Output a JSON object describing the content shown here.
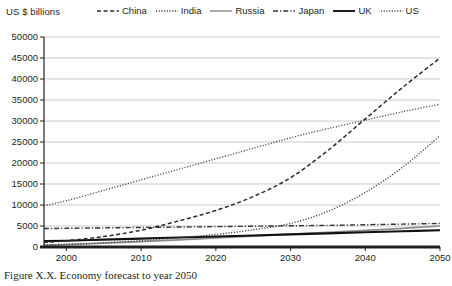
{
  "axis_title": "US $ billions",
  "caption": "Figure X.X. Economy forecast to year 2050",
  "colors": {
    "axis": "#231f20",
    "grid": "#c9c9c9",
    "china": "#2b2b2b",
    "india": "#3d3d3d",
    "russia": "#8c8c8c",
    "japan": "#333333",
    "uk": "#111111",
    "us": "#4a4a4a"
  },
  "legend": {
    "items": [
      {
        "label": "China",
        "style": "dashed",
        "icon": "dashed-line-icon"
      },
      {
        "label": "India",
        "style": "dotted",
        "icon": "dotted-line-icon"
      },
      {
        "label": "Russia",
        "style": "solid",
        "icon": "solid-line-icon"
      },
      {
        "label": "Japan",
        "style": "dashdot",
        "icon": "dash-dot-line-icon"
      },
      {
        "label": "UK",
        "style": "solid",
        "icon": "solid-line-icon"
      },
      {
        "label": "US",
        "style": "dotted",
        "icon": "dotted-line-icon"
      }
    ]
  },
  "chart_data": {
    "type": "line",
    "title": "",
    "xlabel": "",
    "ylabel": "US $ billions",
    "xlim": [
      1997,
      2050
    ],
    "ylim": [
      0,
      50000
    ],
    "ytick_labels": [
      "50000",
      "45000",
      "40000",
      "35000",
      "30000",
      "25000",
      "20000",
      "15000",
      "10000",
      "5000",
      "0"
    ],
    "yticks": [
      50000,
      45000,
      40000,
      35000,
      30000,
      25000,
      20000,
      15000,
      10000,
      5000,
      0
    ],
    "xtick_labels": [
      "2000",
      "2010",
      "2020",
      "2030",
      "2040",
      "2050"
    ],
    "xticks": [
      2000,
      2010,
      2020,
      2030,
      2040,
      2050
    ],
    "grid": "horizontal",
    "legend_position": "top",
    "x": [
      1997,
      2000,
      2005,
      2010,
      2015,
      2020,
      2025,
      2030,
      2035,
      2040,
      2045,
      2050
    ],
    "series": [
      {
        "name": "China",
        "style": "dashed",
        "values": [
          1100,
          1500,
          2500,
          4000,
          6200,
          8700,
          12000,
          16500,
          23000,
          30500,
          38000,
          45000
        ]
      },
      {
        "name": "India",
        "style": "dotted",
        "values": [
          500,
          650,
          1000,
          1500,
          2200,
          3000,
          4100,
          5600,
          8500,
          13000,
          19000,
          26500
        ]
      },
      {
        "name": "Russia",
        "style": "solid",
        "values": [
          400,
          550,
          900,
          1300,
          1700,
          2150,
          2600,
          3050,
          3500,
          3950,
          4450,
          5000
        ]
      },
      {
        "name": "Japan",
        "style": "dashdot",
        "values": [
          4400,
          4450,
          4550,
          4650,
          4750,
          4850,
          4950,
          5050,
          5150,
          5300,
          5450,
          5600
        ]
      },
      {
        "name": "UK",
        "style": "solid",
        "values": [
          1400,
          1500,
          1750,
          2000,
          2250,
          2500,
          2750,
          3000,
          3250,
          3500,
          3750,
          4000
        ]
      },
      {
        "name": "US",
        "style": "dotted",
        "values": [
          9800,
          11000,
          13500,
          16000,
          18500,
          21000,
          23500,
          26000,
          28200,
          30200,
          32200,
          34000
        ]
      }
    ]
  }
}
